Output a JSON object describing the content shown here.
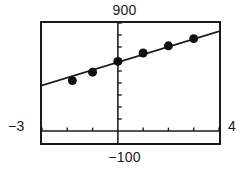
{
  "screen": {
    "kind": "graphing-calculator-plot",
    "background_color": "#ffffff",
    "ink_color": "#1a1a1a"
  },
  "window_labels": {
    "ymax": "900",
    "ymin": "−100",
    "xmin": "−3",
    "xmax": "4"
  },
  "chart_data": {
    "type": "scatter",
    "title": "",
    "xlabel": "",
    "ylabel": "",
    "xlim": [
      -3,
      4
    ],
    "ylim": [
      -100,
      900
    ],
    "grid": false,
    "legend": null,
    "axes": {
      "x_axis_at_y": 0,
      "y_axis_at_x": 0,
      "x_tick_step": 1,
      "y_tick_step": 100,
      "x_ticks": [
        -3,
        -2,
        -1,
        0,
        1,
        2,
        3,
        4
      ],
      "y_ticks": [
        0,
        100,
        200,
        300,
        400,
        500,
        600,
        700,
        800,
        900
      ]
    },
    "series": [
      {
        "name": "data points",
        "marker": "filled-circle",
        "x": [
          -1.8,
          -1.0,
          0.0,
          1.0,
          2.0,
          3.0
        ],
        "y": [
          420,
          490,
          580,
          650,
          710,
          770
        ]
      },
      {
        "name": "regression line",
        "type": "line",
        "x": [
          -3.0,
          4.0
        ],
        "y": [
          380,
          830
        ]
      }
    ]
  }
}
